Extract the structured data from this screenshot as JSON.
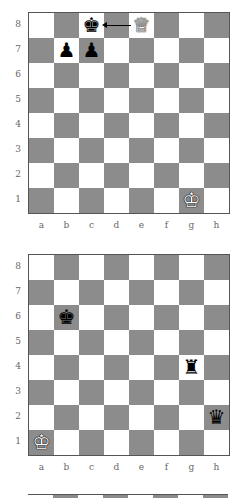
{
  "colors": {
    "light_square": "#ffffff",
    "dark_square": "#8c8c8c",
    "border": "#555555"
  },
  "files": [
    "a",
    "b",
    "c",
    "d",
    "e",
    "f",
    "g",
    "h"
  ],
  "ranks": [
    "8",
    "7",
    "6",
    "5",
    "4",
    "3",
    "2",
    "1"
  ],
  "diagrams": [
    {
      "pieces": [
        {
          "square": "c8",
          "piece": "king",
          "color": "black",
          "glyph": "♚"
        },
        {
          "square": "e8",
          "piece": "queen",
          "color": "white",
          "glyph": "♕"
        },
        {
          "square": "b7",
          "piece": "pawn",
          "color": "black",
          "glyph": "♟"
        },
        {
          "square": "c7",
          "piece": "pawn",
          "color": "black",
          "glyph": "♟"
        },
        {
          "square": "g1",
          "piece": "king",
          "color": "white",
          "glyph": "♔"
        }
      ],
      "arrows": [
        {
          "from": "e8",
          "to": "c8"
        }
      ]
    },
    {
      "pieces": [
        {
          "square": "b6",
          "piece": "king",
          "color": "black",
          "glyph": "♚"
        },
        {
          "square": "g4",
          "piece": "rook",
          "color": "black",
          "glyph": "♜"
        },
        {
          "square": "h2",
          "piece": "queen",
          "color": "black",
          "glyph": "♛"
        },
        {
          "square": "a1",
          "piece": "king",
          "color": "white",
          "glyph": "♔"
        }
      ],
      "arrows": []
    }
  ]
}
